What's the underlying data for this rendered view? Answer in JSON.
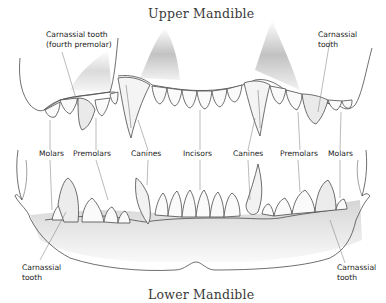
{
  "titles": {
    "upper": "Upper Mandible",
    "lower": "Lower Mandible"
  },
  "labels": {
    "upper_left_carnassial_line1": "Carnassial tooth",
    "upper_left_carnassial_line2": "(fourth premolar)",
    "upper_right_carnassial_line1": "Carnassial",
    "upper_right_carnassial_line2": "tooth",
    "row": [
      {
        "id": "molars-left",
        "text": "Molars"
      },
      {
        "id": "premolars-left",
        "text": "Premolars"
      },
      {
        "id": "canines-left",
        "text": "Canines"
      },
      {
        "id": "incisors",
        "text": "Incisors"
      },
      {
        "id": "canines-right",
        "text": "Canines"
      },
      {
        "id": "premolars-right",
        "text": "Premolars"
      },
      {
        "id": "molars-right",
        "text": "Molars"
      }
    ],
    "lower_left_carnassial_line1": "Carnassial",
    "lower_left_carnassial_line2": "tooth",
    "lower_right_carnassial_line1": "Carnassial",
    "lower_right_carnassial_line2": "tooth"
  },
  "colors": {
    "line": "#4a4a4a",
    "shade": "#9a9a9a",
    "text": "#222222"
  }
}
